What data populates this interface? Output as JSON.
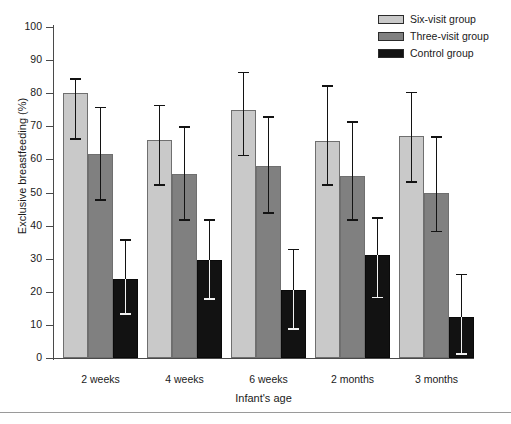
{
  "chart_data": {
    "type": "bar",
    "title": "",
    "xlabel": "Infant's age",
    "ylabel": "Exclusive breastfeeding (%)",
    "ylim": [
      0,
      100
    ],
    "ytick_step": 10,
    "yticks": [
      0,
      10,
      20,
      30,
      40,
      50,
      60,
      70,
      80,
      90,
      100
    ],
    "grid": false,
    "legend_position": "top-right",
    "categories": [
      "2 weeks",
      "4 weeks",
      "6 weeks",
      "2 months",
      "3 months"
    ],
    "error_bar_type": "95% confidence interval",
    "series": [
      {
        "name": "Six-visit group",
        "color": "#c9c9c9",
        "values": [
          80,
          66,
          75,
          65.5,
          67
        ],
        "ci_low": [
          66,
          52,
          61,
          52,
          53
        ],
        "ci_high": [
          84,
          76,
          86,
          82,
          80
        ]
      },
      {
        "name": "Three-visit group",
        "color": "#808080",
        "values": [
          61.5,
          55.5,
          58,
          55,
          50
        ],
        "ci_low": [
          47.5,
          41.5,
          43.5,
          41.5,
          38
        ],
        "ci_high": [
          75.5,
          69.5,
          72.5,
          71,
          66.5
        ]
      },
      {
        "name": "Control group",
        "color": "#121212",
        "values": [
          24,
          29.5,
          20.5,
          31,
          12.5
        ],
        "ci_low": [
          13,
          17.5,
          8.5,
          18,
          1
        ],
        "ci_high": [
          35.5,
          41.5,
          32.5,
          42,
          25
        ]
      }
    ]
  },
  "legend": {
    "items": [
      {
        "label": "Six-visit group",
        "color": "#c9c9c9"
      },
      {
        "label": "Three-visit group",
        "color": "#808080"
      },
      {
        "label": "Control group",
        "color": "#121212"
      }
    ]
  },
  "axes": {
    "y_title": "Exclusive breastfeeding (%)",
    "x_title": "Infant's age",
    "y_tick_labels": [
      "100",
      "90",
      "80",
      "70",
      "60",
      "50",
      "40",
      "30",
      "20",
      "10",
      "0"
    ]
  }
}
